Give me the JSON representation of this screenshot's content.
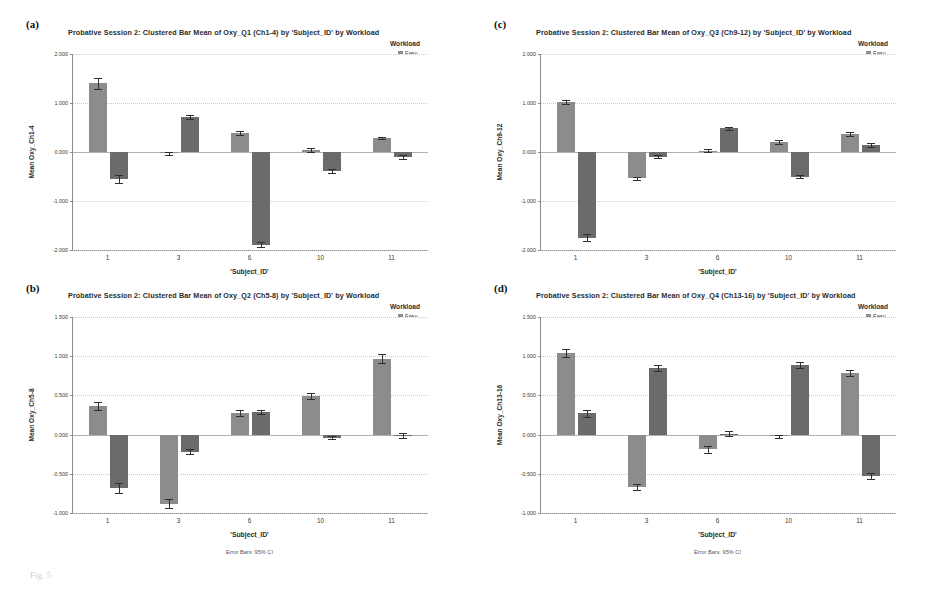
{
  "figure": {
    "caption": "Fig. 5",
    "footnote_label": "Error Bars: 95% CI"
  },
  "colors": {
    "easy": "#8c8c8c",
    "hard": "#6b6b6b",
    "axis": "#8c8c8c",
    "grid": "#c9c9c9",
    "error": "#2f2f2f"
  },
  "common": {
    "legend_title": "Workload",
    "xlabel": "'Subject_ID'",
    "categories": [
      "1",
      "3",
      "6",
      "10",
      "11"
    ],
    "series_names": [
      "Easy",
      "Hard"
    ]
  },
  "panels": [
    {
      "letter": "(a)",
      "title": "Probative Session 2: Clustered Bar Mean of Oxy_Q1 (Ch1-4) by 'Subject_ID' by Workload",
      "ylabel": "Mean Oxy_Ch1-4",
      "yticks": [
        "2.000",
        "1.000",
        "0.000",
        "-1.000",
        "-2.000"
      ],
      "chart_data": {
        "type": "bar",
        "title": "Probative Session 2: Clustered Bar Mean of Oxy_Q1 (Ch1-4) by 'Subject_ID' by Workload",
        "xlabel": "'Subject_ID'",
        "ylabel": "Mean Oxy_Ch1-4",
        "categories": [
          "1",
          "3",
          "6",
          "10",
          "11"
        ],
        "ylim": [
          -2.0,
          2.0
        ],
        "yticks": [
          2.0,
          1.0,
          0.0,
          -1.0,
          -2.0
        ],
        "grid": true,
        "legend_position": "top-right",
        "error_bars": "95% CI",
        "series": [
          {
            "name": "Easy",
            "values": [
              1.4,
              -0.03,
              0.38,
              0.04,
              0.29
            ],
            "errors": [
              0.11,
              0.03,
              0.04,
              0.04,
              0.02
            ]
          },
          {
            "name": "Hard",
            "values": [
              -0.55,
              0.72,
              -1.89,
              -0.38,
              -0.11
            ],
            "errors": [
              0.08,
              0.04,
              0.05,
              0.04,
              0.04
            ]
          }
        ]
      }
    },
    {
      "letter": "(b)",
      "title": "Probative Session 2: Clustered Bar Mean of Oxy_Q2 (Ch5-8) by 'Subject_ID' by Workload",
      "ylabel": "Mean Oxy_Ch5-8",
      "yticks": [
        "1.500",
        "1.000",
        "0.500",
        "0.000",
        "-0.500",
        "-1.000"
      ],
      "chart_data": {
        "type": "bar",
        "title": "Probative Session 2: Clustered Bar Mean of Oxy_Q2 (Ch5-8) by 'Subject_ID' by Workload",
        "xlabel": "'Subject_ID'",
        "ylabel": "Mean Oxy_Ch5-8",
        "categories": [
          "1",
          "3",
          "6",
          "10",
          "11"
        ],
        "ylim": [
          -1.0,
          1.5
        ],
        "yticks": [
          1.5,
          1.0,
          0.5,
          0.0,
          -0.5,
          -1.0
        ],
        "grid": true,
        "legend_position": "top-right",
        "error_bars": "95% CI",
        "series": [
          {
            "name": "Easy",
            "values": [
              0.36,
              -0.88,
              0.28,
              0.49,
              0.97
            ],
            "errors": [
              0.05,
              0.06,
              0.04,
              0.04,
              0.06
            ]
          },
          {
            "name": "Hard",
            "values": [
              -0.68,
              -0.22,
              0.29,
              -0.04,
              -0.01
            ],
            "errors": [
              0.06,
              0.03,
              0.03,
              0.02,
              0.03
            ]
          }
        ]
      }
    },
    {
      "letter": "(c)",
      "title": "Probative Session 2: Clustered Bar Mean of Oxy_Q3 (Ch9-12) by 'Subject_ID' by Workload",
      "ylabel": "Mean Oxy_Ch9-12",
      "yticks": [
        "2.000",
        "1.000",
        "0.000",
        "-1.000",
        "-2.000"
      ],
      "chart_data": {
        "type": "bar",
        "title": "Probative Session 2: Clustered Bar Mean of Oxy_Q3 (Ch9-12) by 'Subject_ID' by Workload",
        "xlabel": "'Subject_ID'",
        "ylabel": "Mean Oxy_Ch9-12",
        "categories": [
          "1",
          "3",
          "6",
          "10",
          "11"
        ],
        "ylim": [
          -2.0,
          2.0
        ],
        "yticks": [
          2.0,
          1.0,
          0.0,
          -1.0,
          -2.0
        ],
        "grid": true,
        "legend_position": "top-right",
        "error_bars": "95% CI",
        "series": [
          {
            "name": "Easy",
            "values": [
              1.02,
              -0.54,
              0.03,
              0.21,
              0.36
            ],
            "errors": [
              0.05,
              0.04,
              0.03,
              0.04,
              0.04
            ]
          },
          {
            "name": "Hard",
            "values": [
              -1.75,
              -0.1,
              0.48,
              -0.5,
              0.14
            ],
            "errors": [
              0.07,
              0.03,
              0.04,
              0.04,
              0.04
            ]
          }
        ]
      }
    },
    {
      "letter": "(d)",
      "title": "Probative Session 2: Clustered Bar Mean of Oxy_Q4 (Ch13-16) by 'Subject_ID' by Workload",
      "ylabel": "Mean Oxy_Ch13-16",
      "yticks": [
        "1.500",
        "1.000",
        "0.500",
        "0.000",
        "-0.500",
        "-1.000"
      ],
      "chart_data": {
        "type": "bar",
        "title": "Probative Session 2: Clustered Bar Mean of Oxy_Q4 (Ch13-16) by 'Subject_ID' by Workload",
        "xlabel": "'Subject_ID'",
        "ylabel": "Mean Oxy_Ch13-16",
        "categories": [
          "1",
          "3",
          "6",
          "10",
          "11"
        ],
        "ylim": [
          -1.0,
          1.5
        ],
        "yticks": [
          1.5,
          1.0,
          0.5,
          0.0,
          -0.5,
          -1.0
        ],
        "grid": true,
        "legend_position": "top-right",
        "error_bars": "95% CI",
        "series": [
          {
            "name": "Easy",
            "values": [
              1.04,
              -0.67,
              -0.19,
              -0.02,
              0.79
            ],
            "errors": [
              0.05,
              0.04,
              0.05,
              0.02,
              0.04
            ]
          },
          {
            "name": "Hard",
            "values": [
              0.27,
              0.85,
              0.01,
              0.89,
              -0.53
            ],
            "errors": [
              0.05,
              0.04,
              0.03,
              0.04,
              0.04
            ]
          }
        ]
      }
    }
  ]
}
